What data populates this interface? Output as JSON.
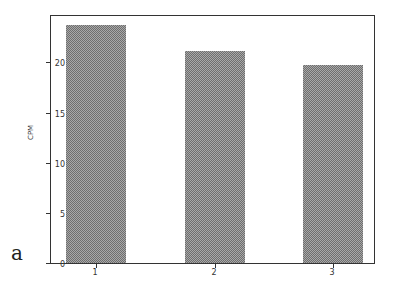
{
  "panel_label": "a",
  "chart_data": {
    "type": "bar",
    "title": "",
    "xlabel": "",
    "ylabel": "CPM",
    "categories": [
      "1",
      "2",
      "3"
    ],
    "values": [
      23.7,
      21.1,
      19.7
    ],
    "ylim": [
      0,
      24.8
    ],
    "yticks": [
      0,
      5,
      10,
      15,
      20
    ],
    "ytick_labels": [
      "0",
      "5",
      "10",
      "15",
      "20"
    ],
    "grid": false,
    "legend": null,
    "bar_fill": "stippled gray pattern",
    "colors": {
      "bar": "#a8a8a8",
      "bar_pattern": "#6e6e6e",
      "axis": "#333333"
    }
  }
}
